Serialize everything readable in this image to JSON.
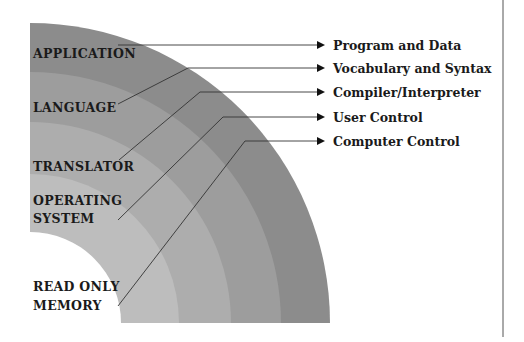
{
  "diagram": {
    "title": "",
    "layers": [
      {
        "name": "application",
        "label_lines": [
          "APPLICATION"
        ],
        "function": "Program and Data",
        "color": "#8c8c8c"
      },
      {
        "name": "language",
        "label_lines": [
          "LANGUAGE"
        ],
        "function": "Vocabulary and Syntax",
        "color": "#9d9d9d"
      },
      {
        "name": "translator",
        "label_lines": [
          "TRANSLATOR"
        ],
        "function": "Compiler/Interpreter",
        "color": "#adadad"
      },
      {
        "name": "operating-system",
        "label_lines": [
          "OPERATING",
          "SYSTEM"
        ],
        "function": "User Control",
        "color": "#bdbdbd"
      },
      {
        "name": "read-only-memory",
        "label_lines": [
          "READ ONLY",
          "MEMORY"
        ],
        "function": "Computer Control",
        "color": "#cbcbcb"
      }
    ]
  },
  "labels": {
    "application": "APPLICATION",
    "language": "LANGUAGE",
    "translator": "TRANSLATOR",
    "os_line1": "OPERATING",
    "os_line2": "SYSTEM",
    "rom_line1": "READ ONLY",
    "rom_line2": "MEMORY",
    "f_program": "Program and Data",
    "f_vocab": "Vocabulary and Syntax",
    "f_compiler": "Compiler/Interpreter",
    "f_user": "User Control",
    "f_computer": "Computer Control"
  }
}
